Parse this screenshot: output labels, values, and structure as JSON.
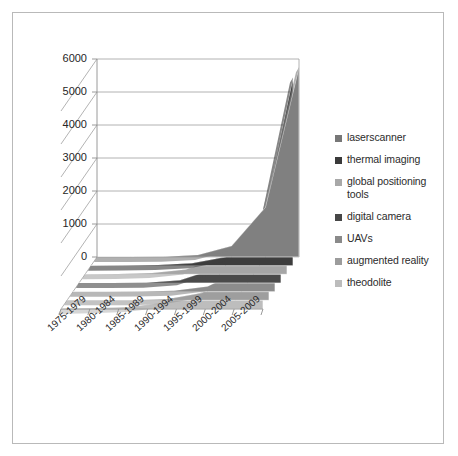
{
  "chart_data": {
    "type": "area",
    "title": "",
    "subtitle": "",
    "xlabel": "",
    "ylabel": "",
    "ylim": [
      0,
      6000
    ],
    "grid": true,
    "legend_position": "right",
    "projection": "3d",
    "categories": [
      "1975-1979",
      "1980-1984",
      "1985-1989",
      "1990-1994",
      "1995-1999",
      "2000-2004",
      "2005-2009"
    ],
    "ytick_labels": [
      "0",
      "1000",
      "2000",
      "3000",
      "4000",
      "5000",
      "6000"
    ],
    "ytick_values": [
      0,
      1000,
      2000,
      3000,
      4000,
      5000,
      6000
    ],
    "series": [
      {
        "name": "laserscanner",
        "color": "#808080",
        "values": [
          0,
          0,
          10,
          60,
          330,
          1500,
          5750
        ]
      },
      {
        "name": "thermal imaging",
        "color": "#3d3d3d",
        "values": [
          0,
          5,
          20,
          70,
          260,
          900,
          5700
        ]
      },
      {
        "name": "global positioning tools",
        "color": "#a6a6a6",
        "values": [
          0,
          10,
          40,
          150,
          500,
          1400,
          1150
        ]
      },
      {
        "name": "digital camera",
        "color": "#4a4a4a",
        "values": [
          0,
          0,
          10,
          80,
          420,
          1250,
          700
        ]
      },
      {
        "name": "UAVs",
        "color": "#8c8c8c",
        "values": [
          0,
          0,
          5,
          30,
          160,
          650,
          480
        ]
      },
      {
        "name": "augmented reality",
        "color": "#9e9e9e",
        "values": [
          0,
          0,
          5,
          40,
          220,
          800,
          430
        ]
      },
      {
        "name": "theodolite",
        "color": "#bdbdbd",
        "values": [
          0,
          20,
          60,
          180,
          430,
          900,
          380
        ]
      }
    ]
  },
  "legend": {
    "items": [
      {
        "label": "laserscanner",
        "color": "#777777"
      },
      {
        "label": "thermal imaging",
        "color": "#3a3a3a"
      },
      {
        "label": "global positioning\ntools",
        "color": "#a8a8a8"
      },
      {
        "label": "digital camera",
        "color": "#474747"
      },
      {
        "label": "UAVs",
        "color": "#8a8a8a"
      },
      {
        "label": "augmented reality",
        "color": "#9c9c9c"
      },
      {
        "label": "theodolite",
        "color": "#bcbcbc"
      }
    ]
  },
  "style": {
    "frame_border": "#b9b9b9",
    "gridline": "#a0a0a0",
    "axis_line": "#8f8f8f",
    "text": "#262626",
    "background": "#ffffff"
  }
}
